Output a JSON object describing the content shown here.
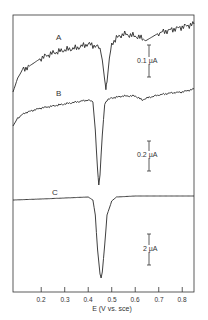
{
  "chart_data": {
    "type": "line",
    "title": "",
    "xlabel": "E (V vs. sce)",
    "ylabel": "",
    "xlim": [
      0.08,
      0.85
    ],
    "x_ticks": [
      0.2,
      0.3,
      0.4,
      0.5,
      0.6,
      0.7,
      0.8
    ],
    "x_tick_labels": [
      "0.2",
      "0.3",
      "0.4",
      "0.5",
      "0.6",
      "0.7",
      "0.8"
    ],
    "grid": false,
    "legend": "none (curves labeled inline A, B, C)",
    "series": [
      {
        "name": "A",
        "scale_bar": "0.1 µA",
        "peak_potential_V": 0.475,
        "x": [
          0.08,
          0.1,
          0.12,
          0.15,
          0.2,
          0.25,
          0.3,
          0.35,
          0.4,
          0.43,
          0.45,
          0.46,
          0.47,
          0.475,
          0.48,
          0.49,
          0.5,
          0.52,
          0.55,
          0.6,
          0.65,
          0.7,
          0.75,
          0.8,
          0.85
        ],
        "y_px": [
          92,
          78,
          70,
          66,
          58,
          53,
          50,
          48,
          44,
          46,
          48,
          60,
          80,
          88,
          82,
          58,
          44,
          38,
          34,
          36,
          40,
          33,
          30,
          27,
          24
        ]
      },
      {
        "name": "B",
        "scale_bar": "0.2 µA",
        "peak_potential_V": 0.445,
        "x": [
          0.08,
          0.1,
          0.13,
          0.17,
          0.2,
          0.25,
          0.3,
          0.35,
          0.4,
          0.42,
          0.43,
          0.44,
          0.445,
          0.45,
          0.46,
          0.47,
          0.48,
          0.5,
          0.55,
          0.6,
          0.63,
          0.65,
          0.7,
          0.75,
          0.8,
          0.85
        ],
        "y_px": [
          126,
          118,
          113,
          110,
          108,
          106,
          104,
          102,
          100,
          102,
          130,
          170,
          185,
          175,
          135,
          104,
          100,
          98,
          96,
          96,
          100,
          98,
          95,
          93,
          92,
          89
        ]
      },
      {
        "name": "C",
        "scale_bar": "2 µA",
        "peak_potential_V": 0.455,
        "x": [
          0.08,
          0.2,
          0.3,
          0.4,
          0.42,
          0.43,
          0.44,
          0.45,
          0.455,
          0.46,
          0.47,
          0.48,
          0.5,
          0.52,
          0.6,
          0.7,
          0.85
        ],
        "y_px": [
          200,
          199,
          198,
          197,
          200,
          215,
          250,
          274,
          278,
          272,
          245,
          215,
          201,
          197,
          196,
          196,
          196
        ]
      }
    ],
    "annotations": [
      "A",
      "B",
      "C",
      "0.1 µA",
      "0.2 µA",
      "2 µA"
    ]
  },
  "labels": {
    "curve_a": "A",
    "curve_b": "B",
    "curve_c": "C",
    "scale_a": "0.1 µA",
    "scale_b": "0.2 µA",
    "scale_c": "2 µA",
    "xlabel": "E (V vs. sce)",
    "ticks": [
      "0.2",
      "0.3",
      "0.4",
      "0.5",
      "0.6",
      "0.7",
      "0.8"
    ]
  }
}
